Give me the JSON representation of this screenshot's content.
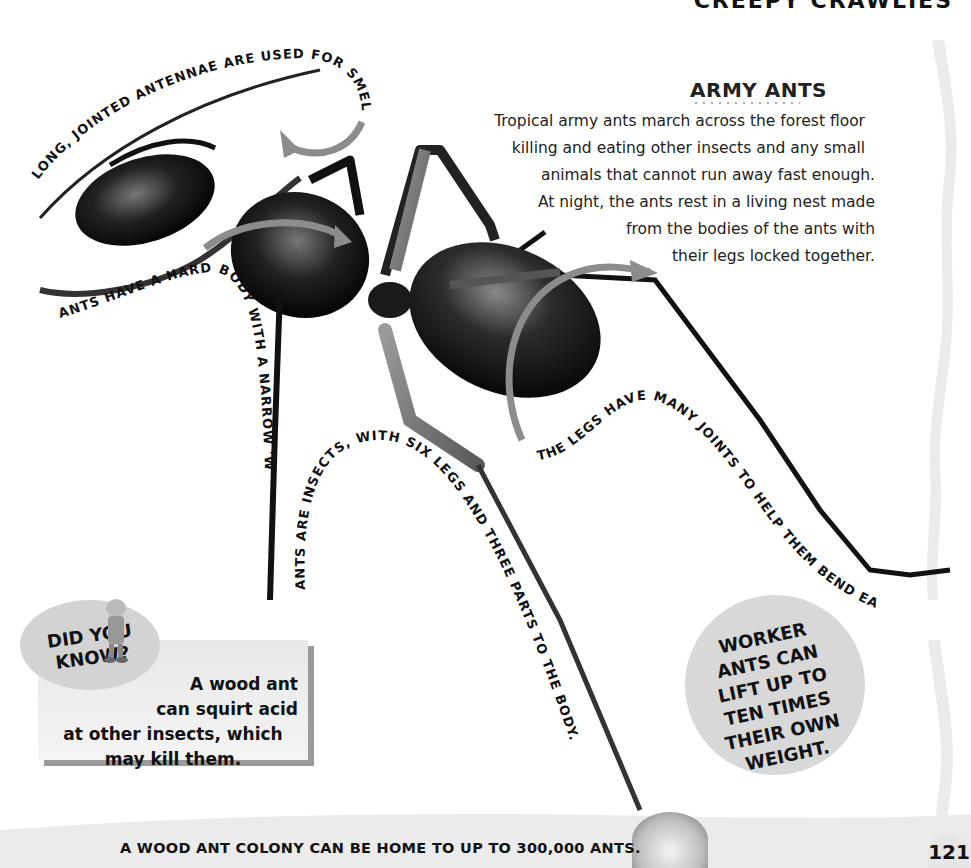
{
  "header": {
    "running_title": "CREEPY CRAWLIES"
  },
  "section": {
    "title": "ARMY ANTS",
    "intro_lines": [
      "Tropical army ants march across the forest floor",
      "killing and eating other insects and any small",
      "animals that cannot run away fast enough.",
      "At night, the ants rest in a living nest made",
      "from the bodies of the ants with",
      "their legs locked together."
    ]
  },
  "labels": {
    "antennae": "LONG, JOINTED ANTENNAE ARE USED FOR SMELLING.",
    "hard_body": "ANTS HAVE A HARD BODY WITH A NARROW 'WAIST'.",
    "six_legs": "ANTS ARE INSECTS, WITH SIX LEGS AND THREE PARTS TO THE BODY.",
    "joints": "THE LEGS HAVE MANY JOINTS TO HELP THEM BEND EASILY."
  },
  "did_you_know": {
    "label_line1": "DID YOU",
    "label_line2": "KNOW?",
    "text_lines": [
      "A wood ant",
      "can squirt acid",
      "at other insects, which",
      "may kill them."
    ]
  },
  "worker_fact": {
    "lines": [
      "WORKER",
      "ANTS CAN",
      "LIFT UP TO",
      "TEN TIMES",
      "THEIR OWN",
      "WEIGHT."
    ]
  },
  "footer": {
    "fact": "A WOOD ANT COLONY CAN BE HOME TO UP TO 300,000 ANTS.",
    "page_number": "121"
  },
  "colors": {
    "arrow_gray": "#8c8c8c",
    "bubble_gray": "#d3d3d3",
    "band_gray": "#ebebeb",
    "text": "#111111"
  }
}
